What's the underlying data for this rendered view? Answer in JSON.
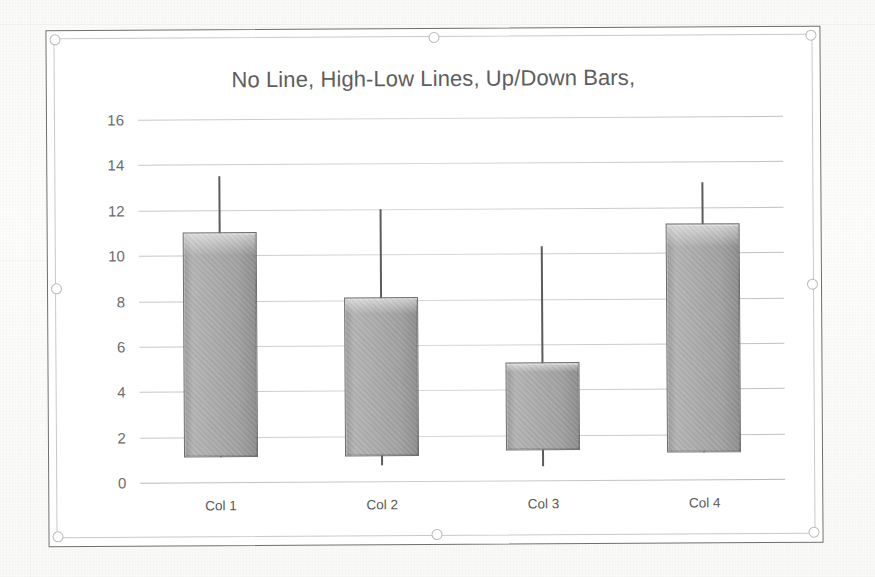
{
  "chart_data": {
    "type": "bar",
    "subtype": "stock-open-high-low-close / up-down bars with high-low lines",
    "title": "No Line, High-Low Lines, Up/Down Bars,",
    "xlabel": "",
    "ylabel": "",
    "categories": [
      "Col 1",
      "Col 2",
      "Col 3",
      "Col 4"
    ],
    "ylim": [
      0,
      16
    ],
    "ytick_interval": 2,
    "yticks": [
      0,
      2,
      4,
      6,
      8,
      10,
      12,
      14,
      16
    ],
    "grid": true,
    "legend": false,
    "series": [
      {
        "name": "High",
        "values": [
          13.5,
          12.0,
          10.3,
          13.1
        ]
      },
      {
        "name": "Bar top",
        "values": [
          11.0,
          8.1,
          5.2,
          11.3
        ]
      },
      {
        "name": "Bar bottom",
        "values": [
          1.1,
          1.1,
          1.3,
          1.2
        ]
      },
      {
        "name": "Low",
        "values": [
          1.1,
          0.7,
          0.6,
          1.2
        ]
      }
    ],
    "bars": [
      {
        "category": "Col 1",
        "high": 13.5,
        "top": 11.0,
        "bottom": 1.1,
        "low": 1.1
      },
      {
        "category": "Col 2",
        "high": 12.0,
        "top": 8.1,
        "bottom": 1.1,
        "low": 0.7
      },
      {
        "category": "Col 3",
        "high": 10.3,
        "top": 5.2,
        "bottom": 1.3,
        "low": 0.6
      },
      {
        "category": "Col 4",
        "high": 13.1,
        "top": 11.3,
        "bottom": 1.2,
        "low": 1.2
      }
    ],
    "colors": {
      "bar_fill": "#a8a8a8",
      "bar_border": "#6e6e6e",
      "line": "#5c5c5c",
      "gridline": "#9a9a9a",
      "title_text": "#5e5e5e",
      "tick_text": "#6b6b6b",
      "chart_border": "#6f6f6f",
      "selection_frame": "#c9c9c9",
      "plot_background": "#ffffff"
    }
  },
  "selection": {
    "handles": [
      "top-left",
      "top-center",
      "top-right",
      "middle-left",
      "middle-right",
      "bottom-left",
      "bottom-center",
      "bottom-right"
    ]
  }
}
